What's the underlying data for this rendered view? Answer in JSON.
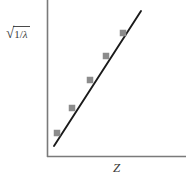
{
  "figure": {
    "background_color": "#ffffff",
    "axis_color": "#7a7a7a",
    "line_color": "#1a1a1a",
    "marker_color": "#8c8c8c",
    "label_color": "#3a3a3a"
  },
  "labels": {
    "ylabel_sqrt_sign": "√",
    "ylabel_numerator": "1",
    "ylabel_slash": "/",
    "ylabel_denominator": "λ",
    "ylabel_full": "√(1/λ)",
    "xlabel": "Z"
  },
  "chart_data": {
    "type": "scatter",
    "title": "",
    "xlabel": "Z",
    "ylabel": "√(1/λ)",
    "grid": false,
    "legend": null,
    "xlim": [
      0,
      10
    ],
    "ylim": [
      0,
      10
    ],
    "axes_ticks": {
      "x": [],
      "y": []
    },
    "series": [
      {
        "name": "Moseley data",
        "marker": "square",
        "x": [
          0.9,
          2.1,
          3.5,
          4.8,
          6.0
        ],
        "y": [
          1.0,
          2.2,
          3.7,
          5.3,
          6.8
        ],
        "pixel_points": [
          {
            "x": 57,
            "y": 133
          },
          {
            "x": 72,
            "y": 108
          },
          {
            "x": 90,
            "y": 80
          },
          {
            "x": 106,
            "y": 56
          },
          {
            "x": 123,
            "y": 33
          }
        ]
      },
      {
        "name": "fit line",
        "marker": "none",
        "x": [
          0.6,
          7.3
        ],
        "y": [
          0.6,
          8.1
        ],
        "pixel_points": [
          {
            "x": 54,
            "y": 146
          },
          {
            "x": 141,
            "y": 11
          }
        ]
      }
    ],
    "axes_pixels": {
      "origin": {
        "x": 47,
        "y": 157
      },
      "x_end": {
        "x": 186,
        "y": 157
      },
      "y_top": {
        "x": 47,
        "y": 0
      }
    }
  }
}
